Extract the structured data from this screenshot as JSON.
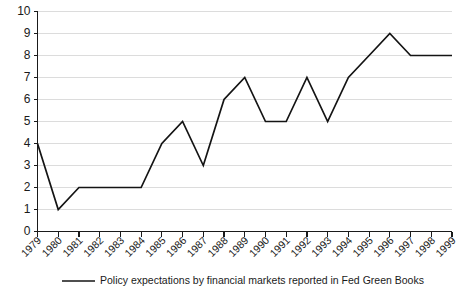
{
  "chart_data": {
    "type": "line",
    "title": "",
    "subtitle": "",
    "xlabel": "",
    "ylabel": "",
    "categories": [
      "1979",
      "1980",
      "1981",
      "1982",
      "1983",
      "1984",
      "1985",
      "1986",
      "1987",
      "1988",
      "1989",
      "1990",
      "1991",
      "1992",
      "1993",
      "1994",
      "1995",
      "1996",
      "1997",
      "1998",
      "1999"
    ],
    "series": [
      {
        "name": "Policy expectations by financial markets reported in Fed Green Books",
        "values": [
          4,
          1,
          2,
          2,
          2,
          2,
          4,
          5,
          3,
          6,
          7,
          5,
          5,
          7,
          5,
          7,
          8,
          9,
          8,
          8,
          8
        ]
      }
    ],
    "ylim": [
      0,
      10
    ],
    "yticks": [
      0,
      1,
      2,
      3,
      4,
      5,
      6,
      7,
      8,
      9,
      10
    ],
    "grid": "horizontal",
    "legend_position": "bottom",
    "colors": {
      "series_line": "#141414",
      "gridline": "#dcdcdc",
      "axis": "#1a1a1a",
      "background": "#ffffff"
    }
  },
  "legend": {
    "entries": [
      {
        "label": "Policy expectations by financial markets reported in Fed Green Books"
      }
    ]
  }
}
